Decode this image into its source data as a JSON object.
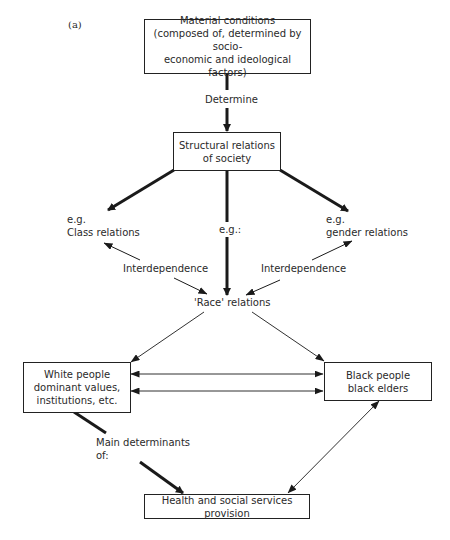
{
  "figure": {
    "label": "(a)"
  },
  "boxes": {
    "material": {
      "lines": [
        "Material conditions",
        "(composed of, determined by socio-",
        "economic and ideological factors)"
      ]
    },
    "structural": {
      "lines": [
        "Structural relations",
        "of society"
      ]
    },
    "white": {
      "lines": [
        "White people",
        "dominant values,",
        "institutions, etc."
      ]
    },
    "black": {
      "lines": [
        "Black people",
        "black elders"
      ]
    },
    "health": {
      "lines": [
        "Health and social services provision"
      ]
    }
  },
  "labels": {
    "determine": "Determine",
    "class": {
      "line1": "e.g.",
      "line2": "Class relations"
    },
    "eg_center": "e.g.:",
    "gender": {
      "line1": "e.g.",
      "line2": "gender relations"
    },
    "interdependence_left": "Interdependence",
    "interdependence_right": "Interdependence",
    "race": "'Race' relations",
    "main_determinants": {
      "line1": "Main determinants",
      "line2": "of:"
    }
  },
  "colors": {
    "line": "#1a1a1a",
    "text": "#2a2a2a",
    "background": "#ffffff"
  }
}
